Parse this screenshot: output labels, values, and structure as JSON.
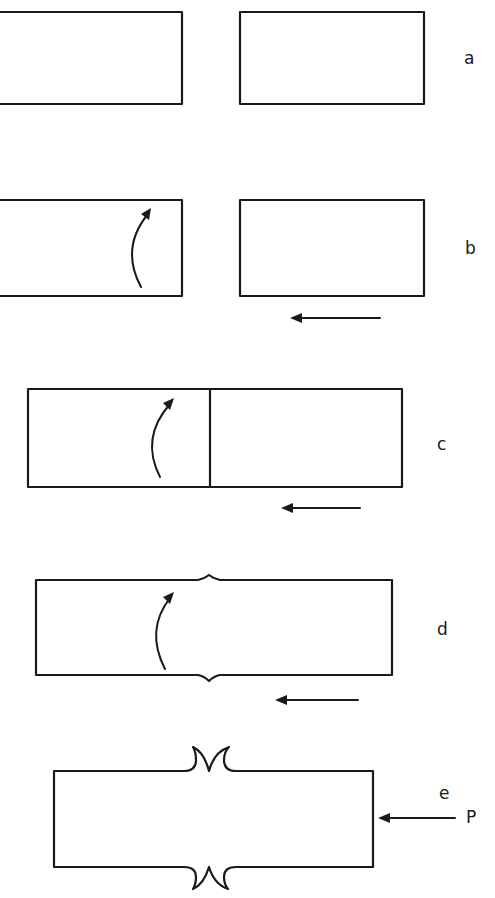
{
  "figure": {
    "type": "schematic sequence",
    "background": "#ffffff",
    "ink_color": "#1a1a1a",
    "panels": [
      {
        "id": "a",
        "label": "a",
        "description": "Two separate rectangular blocks with a gap between them",
        "blocks": 2,
        "rotation_arrow": false,
        "motion_arrow": false
      },
      {
        "id": "b",
        "label": "b",
        "description": "Left block with curved rotation arrow; right block moving left",
        "blocks": 2,
        "rotation_arrow": true,
        "motion_arrow": true,
        "motion_direction": "left"
      },
      {
        "id": "c",
        "label": "c",
        "description": "Blocks in contact along a vertical interface; rotation continues",
        "blocks": 2,
        "rotation_arrow": true,
        "motion_arrow": true,
        "motion_direction": "left"
      },
      {
        "id": "d",
        "label": "d",
        "description": "Joined block with small bulge at the interface; rotation continues",
        "blocks": 1,
        "rotation_arrow": true,
        "motion_arrow": true,
        "motion_direction": "left"
      },
      {
        "id": "e",
        "label": "e",
        "description": "Joined block with expelled flash at interface under axial force P",
        "blocks": 1,
        "rotation_arrow": false,
        "motion_arrow": true,
        "motion_direction": "left",
        "force_label": "P"
      }
    ]
  },
  "labels": {
    "a": "a",
    "b": "b",
    "c": "c",
    "d": "d",
    "e": "e",
    "force": "P"
  }
}
